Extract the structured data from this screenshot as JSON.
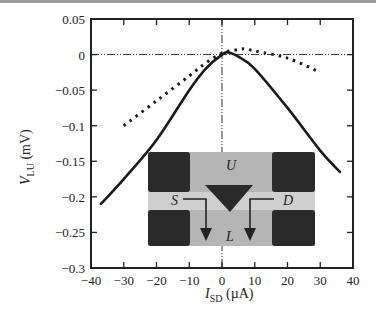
{
  "chart_data": {
    "type": "line",
    "title": "",
    "xlabel": "I_SD (µA)",
    "ylabel": "V_LU (mV)",
    "xlim": [
      -40,
      40
    ],
    "ylim": [
      -0.3,
      0.05
    ],
    "xticks": [
      "-40",
      "-30",
      "-20",
      "-10",
      "0",
      "10",
      "20",
      "30",
      "40"
    ],
    "yticks": [
      "0.05",
      "0",
      "-0.05",
      "-0.1",
      "-0.15",
      "-0.2",
      "-0.25",
      "-0.3"
    ],
    "grid": false,
    "reference_lines": [
      {
        "orientation": "horizontal",
        "value": 0,
        "style": "dash-dot-dot"
      },
      {
        "orientation": "vertical",
        "value": 0,
        "style": "dash-dot-dot"
      }
    ],
    "series": [
      {
        "name": "solid",
        "style": "solid",
        "x": [
          -37,
          -30,
          -20,
          -10,
          -5,
          0,
          2,
          5,
          10,
          20,
          30,
          36
        ],
        "y": [
          -0.21,
          -0.175,
          -0.12,
          -0.05,
          -0.02,
          0.0,
          0.003,
          -0.003,
          -0.02,
          -0.075,
          -0.135,
          -0.165
        ]
      },
      {
        "name": "dotted",
        "style": "dotted",
        "x": [
          -30,
          -20,
          -10,
          -5,
          0,
          5,
          7,
          10,
          20,
          30
        ],
        "y": [
          -0.1,
          -0.065,
          -0.03,
          -0.012,
          0.002,
          0.007,
          0.008,
          0.005,
          -0.005,
          -0.025
        ]
      }
    ],
    "inset": {
      "description": "Device micrograph with triangular gate",
      "labels": {
        "top": "U",
        "bottom": "L",
        "left": "S",
        "right": "D"
      }
    }
  },
  "axes": {
    "xlabel_main": "I",
    "xlabel_sub": "SD",
    "xlabel_unit": " (µA)",
    "ylabel_main": "V",
    "ylabel_sub": "LU",
    "ylabel_unit": " (mV)"
  },
  "inset_labels": {
    "u": "U",
    "l": "L",
    "s": "S",
    "d": "D"
  }
}
